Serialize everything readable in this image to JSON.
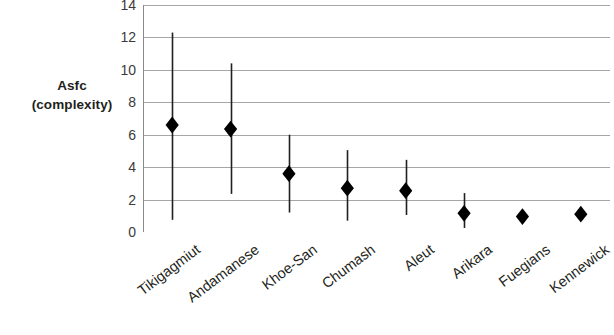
{
  "chart_data": {
    "type": "scatter",
    "title": "",
    "xlabel": "",
    "ylabel": "Asfc (complexity)",
    "ylabel_lines": [
      "Asfc",
      "(complexity)"
    ],
    "ylim": [
      0,
      14
    ],
    "ytick_step": 2,
    "yticks": [
      14,
      12,
      10,
      8,
      6,
      4,
      2,
      0
    ],
    "ytick_labels": [
      "14",
      "12",
      "10",
      "8",
      "6",
      "4",
      "2",
      "0"
    ],
    "grid": true,
    "grid_axis": "y",
    "legend": "none",
    "marker": "diamond",
    "marker_color": "#000000",
    "errorbar_color": "#231f20",
    "gridline_color": "#a6a6a6",
    "axis_color": "#808080",
    "categories": [
      "Tikigagmiut",
      "Andamanese",
      "Khoe-San",
      "Chumash",
      "Aleut",
      "Arikara",
      "Fuegians",
      "Kennewick"
    ],
    "values": [
      6.6,
      6.35,
      3.6,
      2.7,
      2.55,
      1.15,
      0.95,
      1.1
    ],
    "error_low": [
      0.75,
      2.35,
      1.2,
      0.7,
      1.05,
      0.25,
      null,
      null
    ],
    "error_high": [
      12.3,
      10.4,
      6.0,
      5.05,
      4.45,
      2.4,
      null,
      null
    ],
    "points": [
      {
        "category": "Tikigagmiut",
        "value": 6.6,
        "low": 0.75,
        "high": 12.3
      },
      {
        "category": "Andamanese",
        "value": 6.35,
        "low": 2.35,
        "high": 10.4
      },
      {
        "category": "Khoe-San",
        "value": 3.6,
        "low": 1.2,
        "high": 6.0
      },
      {
        "category": "Chumash",
        "value": 2.7,
        "low": 0.7,
        "high": 5.05
      },
      {
        "category": "Aleut",
        "value": 2.55,
        "low": 1.05,
        "high": 4.45
      },
      {
        "category": "Arikara",
        "value": 1.15,
        "low": 0.25,
        "high": 2.4
      },
      {
        "category": "Fuegians",
        "value": 0.95,
        "low": null,
        "high": null
      },
      {
        "category": "Kennewick",
        "value": 1.1,
        "low": null,
        "high": null
      }
    ]
  }
}
